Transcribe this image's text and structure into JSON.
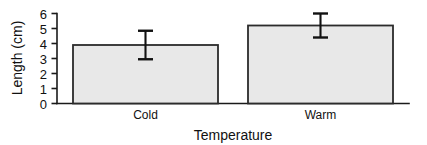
{
  "chart_data": {
    "type": "bar",
    "title": "",
    "subtitle": "",
    "xlabel": "Temperature",
    "ylabel": "Length (cm)",
    "categories": [
      "Cold",
      "Warm"
    ],
    "values": [
      3.9,
      5.2
    ],
    "errors": [
      0.95,
      0.8
    ],
    "error_type": "symmetric",
    "ylim": [
      0,
      6
    ],
    "ytick_labels": [
      "0",
      "1",
      "2",
      "3",
      "4",
      "5",
      "6"
    ],
    "ytick_values": [
      0,
      1,
      2,
      3,
      4,
      5,
      6
    ],
    "grid": false,
    "legend": null,
    "legend_position": "none",
    "bar_fill_color": "#e8e8e8",
    "bar_edge_color": "#2b2b2b",
    "error_bar_color": "#111111",
    "axis_color": "#1a1a1a",
    "background_color": "#ffffff",
    "annotations": []
  },
  "axis": {
    "y_title": "Length (cm)",
    "x_title": "Temperature"
  },
  "ticks": {
    "y": [
      "6",
      "5",
      "4",
      "3",
      "2",
      "1",
      "0"
    ]
  },
  "bars": {
    "cold_label": "Cold",
    "warm_label": "Warm"
  }
}
